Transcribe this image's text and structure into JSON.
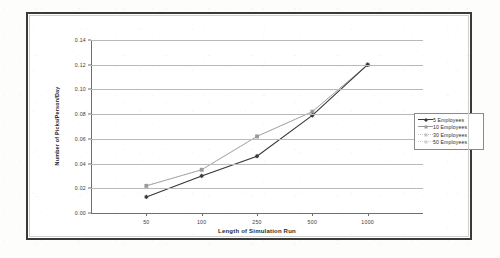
{
  "chart_data": {
    "type": "line",
    "title": "",
    "xlabel": "Length of Simulation Run",
    "ylabel": "Number of Picks/Person/Day",
    "categories": [
      "50",
      "100",
      "250",
      "500",
      "1000"
    ],
    "ylim": [
      0.0,
      0.14
    ],
    "ytick_labels": [
      "0.00",
      "0.02",
      "0.04",
      "0.06",
      "0.08",
      "0.10",
      "0.12",
      "0.14"
    ],
    "ytick_values": [
      0.0,
      0.02,
      0.04,
      0.06,
      0.08,
      0.1,
      0.12,
      0.14
    ],
    "grid": true,
    "legend_position": "right",
    "series": [
      {
        "name": "5 Employees",
        "values": [
          0.013,
          0.03,
          0.046,
          0.079,
          0.12
        ],
        "color": "#3a3a3a",
        "marker": "diamond",
        "line_style": "solid"
      },
      {
        "name": "10 Employees",
        "values": [
          0.022,
          0.035,
          0.062,
          0.082,
          0.12
        ],
        "color": "#9a9a9a",
        "marker": "square",
        "line_style": "solid"
      },
      {
        "name": "30 Employees",
        "values": [
          0.022,
          0.035,
          0.062,
          0.082,
          0.12
        ],
        "color": "#c4c4c4",
        "marker": "triangle",
        "line_style": "dotted"
      },
      {
        "name": "50 Employees",
        "values": [
          0.013,
          0.03,
          0.046,
          0.079,
          0.12
        ],
        "color": "#d0d0d0",
        "marker": "cross",
        "line_style": "dotted"
      }
    ]
  }
}
